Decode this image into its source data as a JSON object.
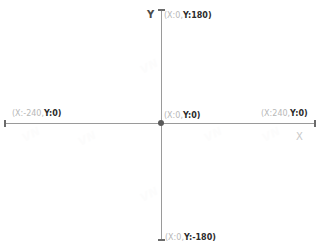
{
  "diagram": {
    "type": "cartesian-coordinate-system",
    "background_color": "#ffffff",
    "axis_color": "#9a9a9a",
    "label_muted_color": "#b8b8b8",
    "label_accent_color": "#2b2b2b",
    "axes": {
      "x_letter": "X",
      "y_letter": "Y"
    },
    "origin_marker": {
      "name": "origin-dot",
      "color": "#5a5a5a"
    },
    "points": [
      {
        "id": "top",
        "prefix": "(X:0,",
        "highlight": "Y:180)",
        "full_label": "(X:0,Y:180)",
        "x": 0,
        "y": 180
      },
      {
        "id": "origin",
        "prefix": "(X:0,",
        "highlight": "Y:0)",
        "full_label": "(X:0,Y:0)",
        "x": 0,
        "y": 0
      },
      {
        "id": "left",
        "prefix": "(X:-240,",
        "highlight": "Y:0)",
        "full_label": "(X:-240,Y:0)",
        "x": -240,
        "y": 0
      },
      {
        "id": "right",
        "prefix": "(X:240,",
        "highlight": "Y:0)",
        "full_label": "(X:240,Y:0)",
        "x": 240,
        "y": 0
      },
      {
        "id": "bottom",
        "prefix": "(X:0,",
        "highlight": "Y:-180)",
        "full_label": "(X:0,Y:-180)",
        "x": 0,
        "y": -180
      }
    ],
    "extents": {
      "x_min": -240,
      "x_max": 240,
      "y_min": -180,
      "y_max": 180
    },
    "watermarks": [
      {
        "text": "VN"
      },
      {
        "text": "VN"
      },
      {
        "text": "VN"
      },
      {
        "text": "VN"
      },
      {
        "text": "VN"
      },
      {
        "text": "VN"
      }
    ]
  }
}
